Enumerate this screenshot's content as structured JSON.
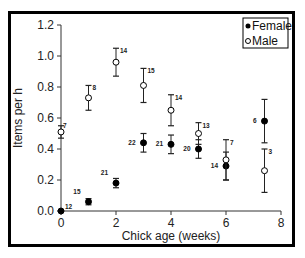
{
  "chart_data": {
    "type": "scatter",
    "title": "",
    "xlabel": "Chick age (weeks)",
    "ylabel": "Items per h",
    "xlim": [
      0,
      8
    ],
    "ylim": [
      0,
      1.2
    ],
    "xticks": [
      "0",
      "2",
      "4",
      "6",
      "8"
    ],
    "yticks": [
      "0.0",
      "0.2",
      "0.4",
      "0.6",
      "0.8",
      "1.0",
      "1.2"
    ],
    "grid": false,
    "legend_position": "upper right",
    "series": [
      {
        "name": "Female",
        "marker": "filled-circle",
        "points": [
          {
            "x": 0,
            "y": 0.0,
            "err": 0.0,
            "n": "12"
          },
          {
            "x": 1,
            "y": 0.06,
            "err": 0.02,
            "n": "15"
          },
          {
            "x": 2,
            "y": 0.18,
            "err": 0.03,
            "n": "21"
          },
          {
            "x": 3,
            "y": 0.44,
            "err": 0.06,
            "n": "22"
          },
          {
            "x": 4,
            "y": 0.43,
            "err": 0.06,
            "n": "21"
          },
          {
            "x": 5,
            "y": 0.4,
            "err": 0.06,
            "n": "20"
          },
          {
            "x": 6,
            "y": 0.29,
            "err": 0.09,
            "n": "14"
          },
          {
            "x": 7.4,
            "y": 0.58,
            "err": 0.14,
            "n": "6"
          }
        ]
      },
      {
        "name": "Male",
        "marker": "open-circle",
        "points": [
          {
            "x": 0,
            "y": 0.51,
            "err": 0.04,
            "n": "7"
          },
          {
            "x": 1,
            "y": 0.73,
            "err": 0.08,
            "n": "8"
          },
          {
            "x": 2,
            "y": 0.96,
            "err": 0.09,
            "n": "14"
          },
          {
            "x": 3,
            "y": 0.81,
            "err": 0.11,
            "n": "15"
          },
          {
            "x": 4,
            "y": 0.65,
            "err": 0.1,
            "n": "14"
          },
          {
            "x": 5,
            "y": 0.5,
            "err": 0.07,
            "n": "13"
          },
          {
            "x": 6,
            "y": 0.33,
            "err": 0.13,
            "n": "7"
          },
          {
            "x": 7.4,
            "y": 0.26,
            "err": 0.14,
            "n": "3"
          }
        ]
      }
    ]
  },
  "legend": {
    "female_label": "Female",
    "male_label": "Male"
  }
}
